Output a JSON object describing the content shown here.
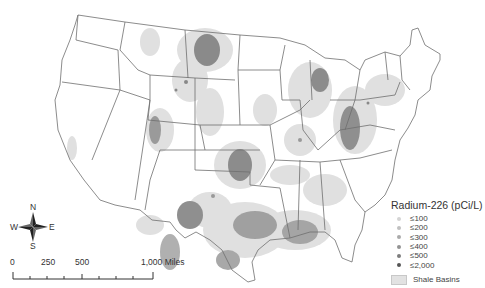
{
  "map": {
    "subject": "Radium-226 concentrations in produced water, conterminous United States",
    "colors": {
      "state_border": "#6f6f6f",
      "shale_basin_fill": "#dedede",
      "point_fill": "#7a7a7a",
      "background": "#ffffff"
    }
  },
  "legend": {
    "title": "Radium-226 (pCi/L)",
    "items": [
      {
        "label": "≤100",
        "color": "#d4d4d4"
      },
      {
        "label": "≤200",
        "color": "#c0c0c0"
      },
      {
        "label": "≤300",
        "color": "#aaaaaa"
      },
      {
        "label": "≤400",
        "color": "#939393"
      },
      {
        "label": "≤500",
        "color": "#7d7d7d"
      },
      {
        "label": "≤2,000",
        "color": "#555555"
      }
    ],
    "basin_label": "Shale Basins"
  },
  "compass": {
    "n": "N",
    "s": "S",
    "e": "E",
    "w": "W"
  },
  "scalebar": {
    "labels": [
      "0",
      "250",
      "500",
      "1,000 Miles"
    ]
  }
}
